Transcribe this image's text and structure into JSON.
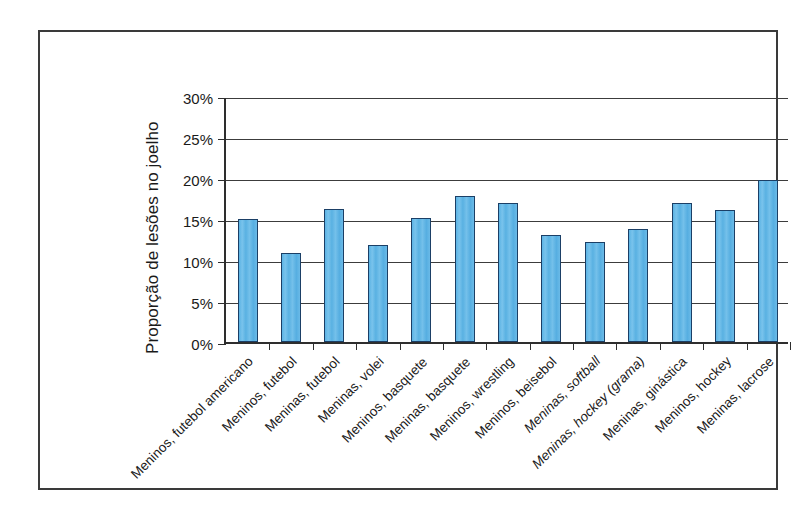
{
  "chart_data": {
    "type": "bar",
    "title": "",
    "subtitle": "",
    "xlabel": "",
    "ylabel": "Proporção de lesões no joelho",
    "ylim": [
      0,
      30
    ],
    "ytick_values": [
      0,
      5,
      10,
      15,
      20,
      25,
      30
    ],
    "ytick_labels": [
      "0%",
      "5%",
      "10%",
      "15%",
      "20%",
      "25%",
      "30%"
    ],
    "grid": true,
    "legend": "none",
    "unit": "%",
    "bar_color": "#5bb3e4",
    "bar_edge_color": "#1b3f66",
    "categories": [
      "Meninos, futebol americano",
      "Meninos, futebol",
      "Meninas, futebol",
      "Meninas, volei",
      "Meninos, basquete",
      "Meninas, basquete",
      "Meninos, wrestling",
      "Meninos, beisebol",
      "Meninas, softball",
      "Meninas, hockey (grama)",
      "Meninas, ginástica",
      "Meninos, hockey",
      "Meninas, lacrose"
    ],
    "category_styles": [
      "normal",
      "normal",
      "normal",
      "normal",
      "normal",
      "normal",
      "normal",
      "normal",
      "italic",
      "italic",
      "normal",
      "normal",
      "normal"
    ],
    "values": [
      15.0,
      10.9,
      16.2,
      11.8,
      15.1,
      17.8,
      17.0,
      13.0,
      12.2,
      13.8,
      16.9,
      16.1,
      19.7
    ]
  }
}
